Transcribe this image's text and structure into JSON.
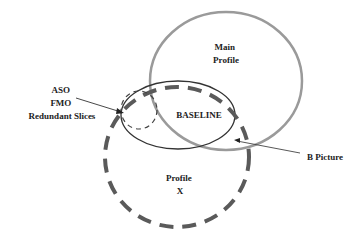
{
  "diagram": {
    "labels": {
      "main_profile": [
        "Main",
        "Profile"
      ],
      "baseline": "BASELINE",
      "profile_x": [
        "Profile",
        "X"
      ],
      "aso_group": [
        "ASO",
        "FMO",
        "Redundant Slices"
      ],
      "b_picture": "B Picture"
    },
    "colors": {
      "main_profile_stroke": "#9a9a9a",
      "baseline_stroke": "#333333",
      "profile_x_stroke": "#5a5a5a",
      "small_dashed_stroke": "#444444",
      "text": "#222222"
    },
    "shapes": [
      {
        "name": "Main Profile",
        "style": "solid gray",
        "cx": 226,
        "cy": 81,
        "rx": 76,
        "ry": 69
      },
      {
        "name": "BASELINE",
        "style": "solid thin dark",
        "cx": 178,
        "cy": 115,
        "rx": 57,
        "ry": 34
      },
      {
        "name": "Profile X",
        "style": "thick dashed",
        "cx": 177,
        "cy": 157,
        "rx": 72,
        "ry": 70
      },
      {
        "name": "ASO/FMO/Redundant Slices region",
        "style": "thin dashed",
        "cx": 139,
        "cy": 110,
        "rx": 18,
        "ry": 19
      }
    ]
  }
}
